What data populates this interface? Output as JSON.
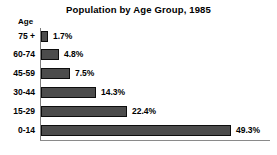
{
  "chart_data": {
    "type": "bar",
    "orientation": "horizontal",
    "title": "Population by Age Group, 1985",
    "xlabel": "",
    "ylabel": "Age",
    "categories": [
      "75 +",
      "60-74",
      "45-59",
      "30-44",
      "15-29",
      "0-14"
    ],
    "values": [
      1.7,
      4.8,
      7.5,
      14.3,
      22.4,
      49.3
    ],
    "value_labels": [
      "1.7%",
      "4.8%",
      "7.5%",
      "14.3%",
      "22.4%",
      "49.3%"
    ],
    "unit": "%",
    "xlim": [
      0,
      49.3
    ],
    "grid": false,
    "legend": false,
    "legend_position": "none",
    "bar_color": "#4c4c4c",
    "bar_border_color": "#0d0d0d",
    "background_color": "#ffffff",
    "text_color": "#000000",
    "axis_color": "#8a8a8a",
    "px_per_percent": 3.85
  }
}
